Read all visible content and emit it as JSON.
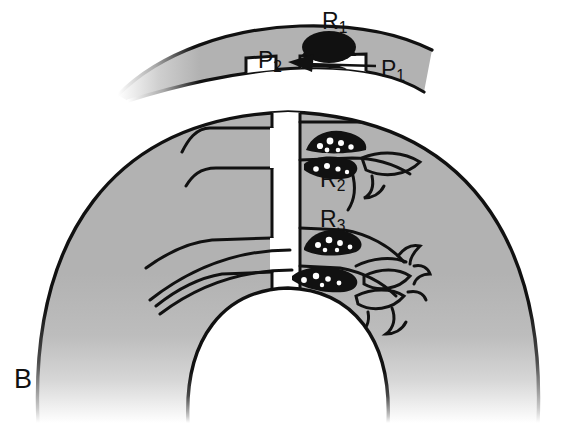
{
  "figure": {
    "panel_letter": "B",
    "background_color": "#ffffff",
    "tissue_fill_color": "#b2b2b2",
    "tissue_fade_color": "#ffffff",
    "outline_color": "#111111",
    "mass_color": "#111111",
    "duct_lumen_color": "#ffffff"
  },
  "labels": {
    "panel": "B",
    "r1": {
      "base": "R",
      "sub": "1"
    },
    "r2": {
      "base": "R",
      "sub": "2"
    },
    "r3": {
      "base": "R",
      "sub": "3"
    },
    "p1": {
      "base": "P",
      "sub": "1"
    },
    "p2": {
      "base": "P",
      "sub": "2"
    }
  },
  "annotations": {
    "arrow_direction": "leftward",
    "arrow_from": "P1",
    "arrow_to": "P2"
  },
  "structures": [
    {
      "name": "upper-band",
      "description": "curved gray band across top"
    },
    {
      "name": "main-dome",
      "description": "large gray dome body"
    },
    {
      "name": "central-duct",
      "description": "vertical white duct trunk"
    },
    {
      "name": "inner-lumen",
      "description": "large white rounded cavity at bottom center"
    },
    {
      "name": "mass-r1",
      "description": "solid dark mass in upper band at P1-P2 level"
    },
    {
      "name": "mass-r2",
      "description": "speckled dark mass on right mid branch"
    },
    {
      "name": "mass-r3",
      "description": "speckled dark mass on right lower branch"
    },
    {
      "name": "branch-network-right",
      "description": "fine branching tubules on right side"
    }
  ]
}
